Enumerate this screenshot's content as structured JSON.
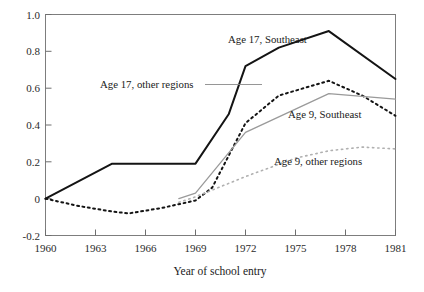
{
  "chart_data": {
    "type": "line",
    "title": "",
    "xlabel": "Year of school entry",
    "ylabel": "",
    "xlim": [
      1960,
      1981
    ],
    "ylim": [
      -0.2,
      1.0
    ],
    "xticks": [
      1960,
      1963,
      1966,
      1969,
      1972,
      1975,
      1978,
      1981
    ],
    "xtick_labels": [
      "1960",
      "1963",
      "1966",
      "1969",
      "1972",
      "1975",
      "1978",
      "1981"
    ],
    "yticks": [
      -0.2,
      0,
      0.2,
      0.4,
      0.6,
      0.8,
      1.0
    ],
    "ytick_labels": [
      "-0.2",
      "0",
      "0.2",
      "0.4",
      "0.6",
      "0.8",
      "1.0"
    ],
    "grid": false,
    "legend_position": "inline-annotations",
    "series": [
      {
        "name": "Age 17, Southeast",
        "style": "solid",
        "color": "#141414",
        "width": 2.0,
        "x": [
          1960,
          1964,
          1969,
          1971,
          1972,
          1974,
          1977,
          1981
        ],
        "values": [
          0.0,
          0.19,
          0.19,
          0.46,
          0.72,
          0.82,
          0.91,
          0.65
        ]
      },
      {
        "name": "Age 17, other regions",
        "style": "dotted-heavy",
        "color": "#141414",
        "width": 2.0,
        "x": [
          1960,
          1962,
          1964,
          1965,
          1967,
          1969,
          1970,
          1972,
          1974,
          1977,
          1979,
          1981
        ],
        "values": [
          0.0,
          -0.04,
          -0.07,
          -0.08,
          -0.05,
          -0.01,
          0.06,
          0.41,
          0.56,
          0.64,
          0.56,
          0.45
        ]
      },
      {
        "name": "Age 9, Southeast",
        "style": "solid",
        "color": "#9a9a9a",
        "width": 1.3,
        "x": [
          1968,
          1969,
          1972,
          1977,
          1981
        ],
        "values": [
          0.0,
          0.03,
          0.36,
          0.57,
          0.54
        ]
      },
      {
        "name": "Age 9, other regions",
        "style": "dotted-light",
        "color": "#b0b0b0",
        "width": 1.6,
        "x": [
          1968,
          1969,
          1972,
          1975,
          1977,
          1979,
          1981
        ],
        "values": [
          -0.02,
          0.01,
          0.12,
          0.22,
          0.26,
          0.28,
          0.27
        ]
      }
    ],
    "annotations": [
      {
        "name": "age-17-southeast",
        "text": "Age 17, Southeast",
        "x": 228,
        "y": 43,
        "anchor": "start",
        "leader": null
      },
      {
        "name": "age-17-other-regions",
        "text": "Age 17, other regions",
        "x": 100,
        "y": 88,
        "anchor": "start",
        "leader": {
          "x1": 205,
          "y1": 84.5,
          "x2": 262,
          "y2": 84.5
        }
      },
      {
        "name": "age-9-southeast",
        "text": "Age 9, Southeast",
        "x": 288,
        "y": 118,
        "anchor": "start",
        "leader": null
      },
      {
        "name": "age-9-other-regions",
        "text": "Age 9, other regions",
        "x": 274,
        "y": 165,
        "anchor": "start",
        "leader": null
      }
    ]
  },
  "colors": {
    "background": "#ffffff",
    "frame": "#7d7d7d",
    "dark_series": "#141414",
    "light_series": "#9a9a9a",
    "lighter_series": "#b0b0b0",
    "text": "#1a1a1a"
  }
}
